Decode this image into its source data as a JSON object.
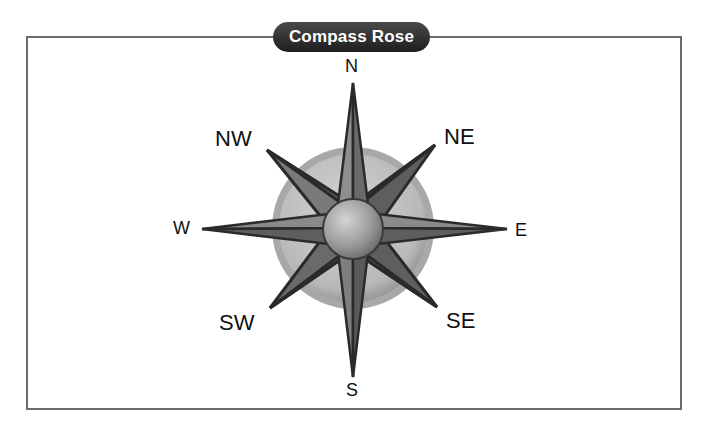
{
  "title": "Compass Rose",
  "directions": {
    "north": "N",
    "south": "S",
    "east": "E",
    "west": "W",
    "northeast": "NE",
    "northwest": "NW",
    "southeast": "SE",
    "southwest": "SW"
  },
  "colors": {
    "frame": "#6a6a6a",
    "title_bg": "#2a2a2a",
    "title_text": "#ffffff",
    "disc": "#bdbdbd",
    "point_light": "#8a8a8a",
    "point_dark": "#555555",
    "outline": "#2a2a2a"
  }
}
